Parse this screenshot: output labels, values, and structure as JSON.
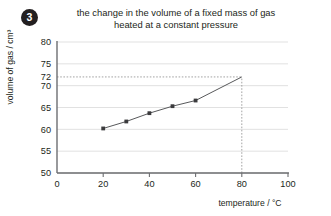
{
  "badge": {
    "number": "3",
    "icon": "question-number-badge"
  },
  "chart_data": {
    "type": "line",
    "title": "the change in the volume of a fixed mass of gas heated at a constant pressure",
    "title_line1": "the change in the volume of a fixed mass of gas",
    "title_line2": "heated at a constant pressure",
    "xlabel": "temperature / °C",
    "ylabel": "volume of gas / cm³",
    "xlim": [
      0,
      100
    ],
    "ylim": [
      50,
      80
    ],
    "xticks": [
      0,
      20,
      40,
      60,
      80,
      100
    ],
    "xtick_labels": [
      "0",
      "20",
      "40",
      "60",
      "80",
      "100"
    ],
    "yticks": [
      50,
      55,
      60,
      65,
      70,
      75,
      80
    ],
    "ytick_labels": [
      "50",
      "55",
      "60",
      "65",
      "70",
      "75",
      "80"
    ],
    "extra_ytick": 72,
    "extra_ytick_label": "72",
    "grid": true,
    "grid_axis": "y",
    "legend": false,
    "x": [
      20,
      30,
      40,
      50,
      60
    ],
    "values": [
      60.2,
      61.8,
      63.7,
      65.3,
      66.6
    ],
    "series": [
      {
        "name": "volume of gas",
        "x": [
          20,
          30,
          40,
          50,
          60
        ],
        "values": [
          60.2,
          61.8,
          63.7,
          65.3,
          66.6
        ]
      }
    ],
    "extrapolation": {
      "from": [
        60,
        66.6
      ],
      "to": [
        80,
        72.0
      ]
    },
    "guide_lines": [
      {
        "name": "horizontal-guide-72",
        "orientation": "horizontal",
        "value": 72,
        "from_x": 0,
        "to_x": 80
      },
      {
        "name": "vertical-guide-80",
        "orientation": "vertical",
        "value": 80,
        "from_y": 50,
        "to_y": 72
      }
    ]
  }
}
